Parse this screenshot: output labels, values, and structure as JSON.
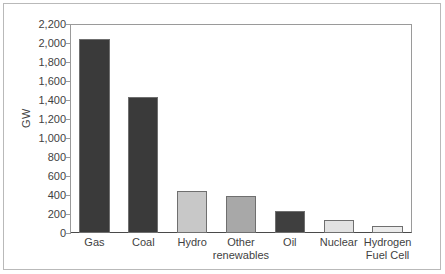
{
  "chart_data": {
    "type": "bar",
    "title": "",
    "xlabel": "",
    "ylabel": "GW",
    "ylim": [
      0,
      2200
    ],
    "grid": false,
    "legend": false,
    "categories": [
      "Gas",
      "Coal",
      "Hydro",
      "Other renewables",
      "Oil",
      "Nuclear",
      "Hydrogen Fuel Cell"
    ],
    "category_label_lines": [
      [
        "Gas"
      ],
      [
        "Coal"
      ],
      [
        "Hydro"
      ],
      [
        "Other",
        "renewables"
      ],
      [
        "Oil"
      ],
      [
        "Nuclear"
      ],
      [
        "Hydrogen",
        "Fuel Cell"
      ]
    ],
    "values": [
      2040,
      1430,
      440,
      385,
      235,
      135,
      75
    ],
    "bar_colors": [
      "#3a3a3a",
      "#3a3a3a",
      "#c8c8c8",
      "#a8a8a8",
      "#3f3f3f",
      "#e2e2e2",
      "#ebebeb"
    ],
    "bar_edge_color": "#6f6f6f",
    "ytick_values": [
      0,
      200,
      400,
      600,
      800,
      1000,
      1200,
      1400,
      1600,
      1800,
      2000,
      2200
    ],
    "ytick_labels": [
      "0",
      "200",
      "400",
      "600",
      "800",
      "1,000",
      "1,200",
      "1,400",
      "1,600",
      "1,800",
      "2,000",
      "2,200"
    ]
  },
  "axes": {
    "y_title": "GW"
  },
  "colors": {
    "text": "#3f3f3f",
    "axis": "#9a9a9a",
    "baseline": "#4a4a4a",
    "frame": "#b9b9b9",
    "background": "#ffffff"
  }
}
